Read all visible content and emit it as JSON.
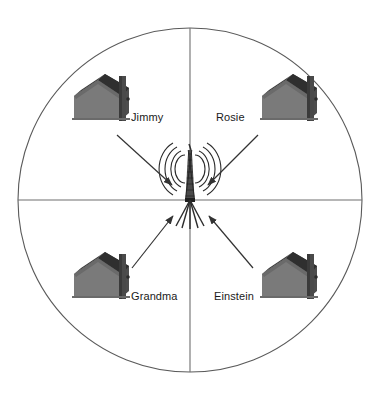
{
  "figure": {
    "type": "network-coverage-diagram",
    "colors": {
      "background": "#ffffff",
      "outline": "#5a5a5a",
      "axis": "#6e6e6e",
      "house_wall": "#7a7a7a",
      "house_roof": "#3a3a3a",
      "house_side": "#5c5c5c",
      "house_chimney": "#4a4a4a",
      "tower": "#2b2b2b",
      "arrow": "#333333",
      "label_text": "#1a1a1a"
    }
  },
  "coverage_circle": {
    "center_x": 190,
    "center_y": 200,
    "radius": 172,
    "axis_horizontal": true,
    "axis_vertical": true,
    "quadrants": 4
  },
  "tower": {
    "name": "radio-transmission-tower",
    "x": 190,
    "y": 200,
    "signal_arcs_per_side": 4
  },
  "houses": [
    {
      "id": "jimmy",
      "label": "Jimmy",
      "quadrant": "top-left",
      "house_x": 70,
      "house_y": 82,
      "label_x": 131,
      "label_y": 111,
      "arrow": {
        "x1": 117,
        "y1": 135,
        "x2": 172,
        "y2": 185
      }
    },
    {
      "id": "rosie",
      "label": "Rosie",
      "quadrant": "top-right",
      "house_x": 258,
      "house_y": 82,
      "label_x": 216,
      "label_y": 111,
      "arrow": {
        "x1": 258,
        "y1": 135,
        "x2": 208,
        "y2": 185
      }
    },
    {
      "id": "grandma",
      "label": "Grandma",
      "quadrant": "bottom-left",
      "house_x": 70,
      "house_y": 252,
      "label_x": 131,
      "label_y": 290,
      "arrow": {
        "x1": 132,
        "y1": 268,
        "x2": 173,
        "y2": 216
      }
    },
    {
      "id": "einstein",
      "label": "Einstein",
      "quadrant": "bottom-right",
      "house_x": 258,
      "house_y": 252,
      "label_x": 214,
      "label_y": 290,
      "arrow": {
        "x1": 253,
        "y1": 268,
        "x2": 209,
        "y2": 216
      }
    }
  ]
}
